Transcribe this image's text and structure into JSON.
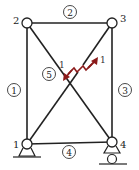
{
  "diagram": {
    "type": "truss",
    "colors": {
      "member": "#222222",
      "node_fill": "#ffffff",
      "arrow": "#8b1a1a"
    },
    "nodes": [
      {
        "id": "1",
        "label": "1",
        "x": 27,
        "y": 144,
        "support": "pin"
      },
      {
        "id": "2",
        "label": "2",
        "x": 27,
        "y": 23,
        "support": "none"
      },
      {
        "id": "3",
        "label": "3",
        "x": 112,
        "y": 23,
        "support": "none"
      },
      {
        "id": "4",
        "label": "4",
        "x": 112,
        "y": 142,
        "support": "roller"
      }
    ],
    "members": [
      {
        "id": "1",
        "label": "1",
        "from": "1",
        "to": "2"
      },
      {
        "id": "2",
        "label": "2",
        "from": "2",
        "to": "3"
      },
      {
        "id": "3",
        "label": "3",
        "from": "3",
        "to": "4"
      },
      {
        "id": "4",
        "label": "4",
        "from": "1",
        "to": "4"
      },
      {
        "id": "5",
        "label": "5",
        "from": "2",
        "to": "4"
      },
      {
        "id": "6",
        "label": "",
        "from": "1",
        "to": "3",
        "note": "cut member with opposing forces"
      }
    ],
    "cut_forces": {
      "label_left": "1",
      "label_right": "1"
    }
  }
}
